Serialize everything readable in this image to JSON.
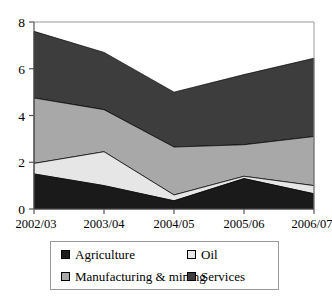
{
  "chart_data": {
    "type": "area",
    "stacked": true,
    "title": "",
    "xlabel": "",
    "ylabel": "",
    "categories": [
      "2002/03",
      "2003/04",
      "2004/05",
      "2005/06",
      "2006/07"
    ],
    "series": [
      {
        "name": "Agriculture",
        "color": "#1a1a1a",
        "values": [
          1.5,
          1.0,
          0.35,
          1.3,
          0.65
        ]
      },
      {
        "name": "Oil",
        "color": "#e6e6e6",
        "values": [
          0.45,
          1.45,
          0.25,
          0.1,
          0.35
        ]
      },
      {
        "name": "Manufacturing & mining",
        "color": "#a8a8a8",
        "values": [
          2.8,
          1.8,
          2.05,
          1.35,
          2.1
        ]
      },
      {
        "name": "Services",
        "color": "#3d3d3d",
        "values": [
          2.85,
          2.45,
          2.35,
          3.0,
          3.35
        ]
      }
    ],
    "cumulative_tops": {
      "2002/03": [
        1.5,
        1.95,
        4.75,
        7.6
      ],
      "2003/04": [
        1.0,
        2.45,
        4.25,
        6.7
      ],
      "2004/05": [
        0.35,
        0.6,
        2.65,
        5.0
      ],
      "2005/06": [
        1.3,
        1.4,
        2.75,
        5.75
      ],
      "2006/07": [
        0.65,
        1.0,
        3.1,
        6.45
      ]
    },
    "ylim": [
      0,
      8
    ],
    "yticks": [
      0,
      2,
      4,
      6,
      8
    ],
    "ytick_labels": [
      "0",
      "2",
      "4",
      "6",
      "8"
    ],
    "grid": false,
    "legend_position": "bottom"
  },
  "legend": {
    "entries": [
      {
        "label": "Agriculture"
      },
      {
        "label": "Oil"
      },
      {
        "label": "Manufacturing & mining"
      },
      {
        "label": "Services"
      }
    ]
  }
}
